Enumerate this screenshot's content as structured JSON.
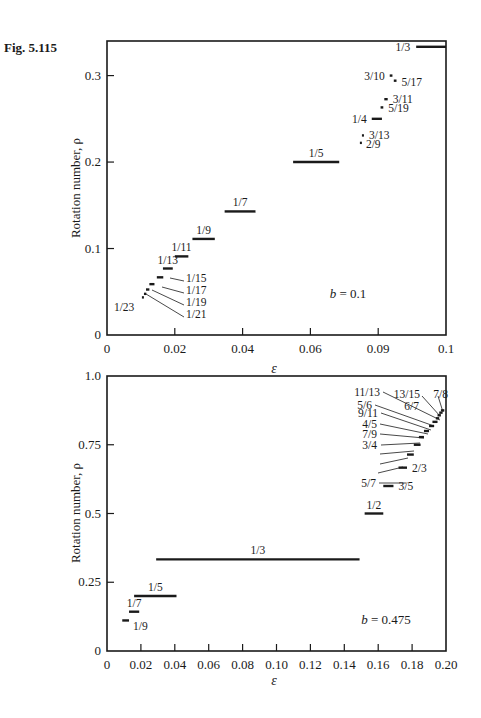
{
  "figure": {
    "label": "Fig. 5.115"
  },
  "chart_data": [
    {
      "type": "line",
      "title": "",
      "xlabel": "ε",
      "ylabel": "Rotation number, ρ",
      "annotation": "b = 0.1",
      "xlim": [
        0,
        0.1
      ],
      "ylim": [
        0,
        0.34
      ],
      "grid": false,
      "x_ticks": [
        0,
        0.02,
        0.04,
        0.06,
        0.08,
        0.1
      ],
      "x_tick_labels": [
        "0",
        "0.02",
        "0.04",
        "0.06",
        "0.09",
        "0.1"
      ],
      "y_ticks": [
        0,
        0.1,
        0.2,
        0.3
      ],
      "y_tick_labels": [
        "0",
        "0.1",
        "0.2",
        "0.3"
      ],
      "plateaus": [
        {
          "label": "1/23",
          "rho": 0.0435,
          "x0": 0.0103,
          "x1": 0.0108
        },
        {
          "label": "1/21",
          "rho": 0.0476,
          "x0": 0.0109,
          "x1": 0.0116
        },
        {
          "label": "1/19",
          "rho": 0.0526,
          "x0": 0.0115,
          "x1": 0.0125
        },
        {
          "label": "1/17",
          "rho": 0.0588,
          "x0": 0.0125,
          "x1": 0.014
        },
        {
          "label": "1/15",
          "rho": 0.0667,
          "x0": 0.0147,
          "x1": 0.0166
        },
        {
          "label": "1/13",
          "rho": 0.0769,
          "x0": 0.0165,
          "x1": 0.0194
        },
        {
          "label": "1/11",
          "rho": 0.0909,
          "x0": 0.02,
          "x1": 0.024
        },
        {
          "label": "1/9",
          "rho": 0.1111,
          "x0": 0.0252,
          "x1": 0.0318
        },
        {
          "label": "1/7",
          "rho": 0.1429,
          "x0": 0.0347,
          "x1": 0.0438
        },
        {
          "label": "1/5",
          "rho": 0.2,
          "x0": 0.0549,
          "x1": 0.0685
        },
        {
          "label": "2/9",
          "rho": 0.2222,
          "x0": 0.0746,
          "x1": 0.0749
        },
        {
          "label": "3/13",
          "rho": 0.2308,
          "x0": 0.0752,
          "x1": 0.0758
        },
        {
          "label": "1/4",
          "rho": 0.25,
          "x0": 0.0781,
          "x1": 0.0811
        },
        {
          "label": "5/19",
          "rho": 0.2632,
          "x0": 0.0807,
          "x1": 0.0815
        },
        {
          "label": "3/11",
          "rho": 0.2727,
          "x0": 0.0818,
          "x1": 0.0828
        },
        {
          "label": "5/17",
          "rho": 0.2941,
          "x0": 0.0846,
          "x1": 0.0854
        },
        {
          "label": "3/10",
          "rho": 0.3,
          "x0": 0.0834,
          "x1": 0.0842
        },
        {
          "label": "1/3",
          "rho": 0.3333,
          "x0": 0.0912,
          "x1": 0.1
        }
      ]
    },
    {
      "type": "line",
      "title": "",
      "xlabel": "ε",
      "ylabel": "Rotation number, ρ",
      "annotation": "b = 0.475",
      "xlim": [
        0,
        0.2
      ],
      "ylim": [
        0,
        1.0
      ],
      "grid": false,
      "x_ticks": [
        0,
        0.02,
        0.04,
        0.06,
        0.08,
        0.1,
        0.12,
        0.14,
        0.16,
        0.18,
        0.2
      ],
      "x_tick_labels": [
        "0",
        "0.02",
        "0.04",
        "0.06",
        "0.08",
        "0.10",
        "0.12",
        "0.14",
        "0.16",
        "0.18",
        "0.20"
      ],
      "y_ticks": [
        0,
        0.25,
        0.5,
        0.75,
        1.0
      ],
      "y_tick_labels": [
        "0",
        "0.25",
        "0.5",
        "0.75",
        "1.0"
      ],
      "plateaus": [
        {
          "label": "1/9",
          "rho": 0.1111,
          "x0": 0.009,
          "x1": 0.013
        },
        {
          "label": "1/7",
          "rho": 0.1429,
          "x0": 0.013,
          "x1": 0.019
        },
        {
          "label": "1/5",
          "rho": 0.2,
          "x0": 0.016,
          "x1": 0.041
        },
        {
          "label": "1/3",
          "rho": 0.3333,
          "x0": 0.029,
          "x1": 0.149
        },
        {
          "label": "1/2",
          "rho": 0.5,
          "x0": 0.152,
          "x1": 0.163
        },
        {
          "label": "3/5",
          "rho": 0.6,
          "x0": 0.163,
          "x1": 0.169
        },
        {
          "label": "2/3",
          "rho": 0.6667,
          "x0": 0.172,
          "x1": 0.177
        },
        {
          "label": "5/7",
          "rho": 0.7143,
          "x0": 0.177,
          "x1": 0.181
        },
        {
          "label": "3/4",
          "rho": 0.75,
          "x0": 0.181,
          "x1": 0.185
        },
        {
          "label": "7/9",
          "rho": 0.7778,
          "x0": 0.184,
          "x1": 0.187
        },
        {
          "label": "4/5",
          "rho": 0.8,
          "x0": 0.187,
          "x1": 0.19
        },
        {
          "label": "9/11",
          "rho": 0.8182,
          "x0": 0.19,
          "x1": 0.193
        },
        {
          "label": "5/6",
          "rho": 0.8333,
          "x0": 0.192,
          "x1": 0.195
        },
        {
          "label": "11/13",
          "rho": 0.8462,
          "x0": 0.194,
          "x1": 0.196
        },
        {
          "label": "6/7",
          "rho": 0.8571,
          "x0": 0.195,
          "x1": 0.197
        },
        {
          "label": "13/15",
          "rho": 0.8667,
          "x0": 0.196,
          "x1": 0.198
        },
        {
          "label": "7/8",
          "rho": 0.875,
          "x0": 0.197,
          "x1": 0.199
        }
      ]
    }
  ]
}
